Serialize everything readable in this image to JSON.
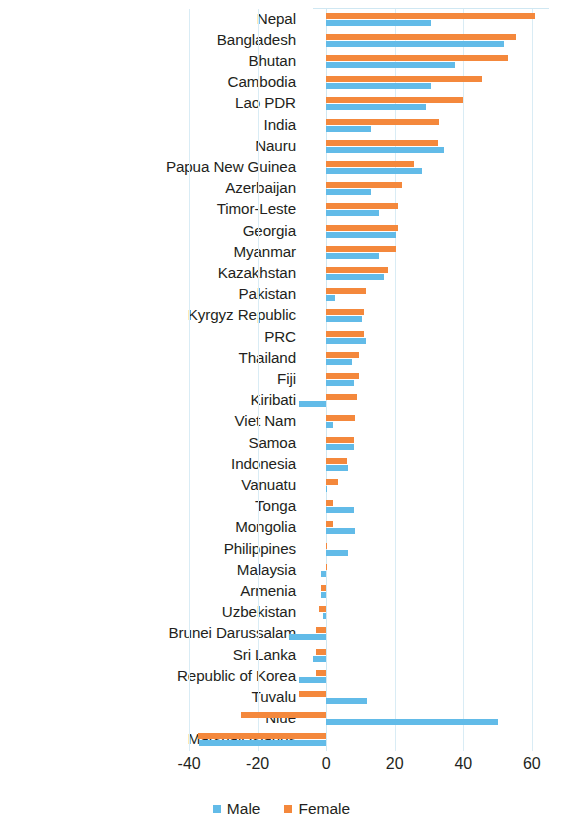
{
  "chart_data": {
    "type": "bar",
    "orientation": "horizontal",
    "title": "",
    "subtitle": "",
    "xlabel": "",
    "ylabel": "",
    "xlim": [
      -45,
      65
    ],
    "xticks": [
      "-40",
      "-20",
      "0",
      "20",
      "40",
      "60"
    ],
    "xtick_values": [
      -40,
      -20,
      0,
      20,
      40,
      60
    ],
    "grid": true,
    "legend_position": "bottom",
    "categories": [
      "Nepal",
      "Bangladesh",
      "Bhutan",
      "Cambodia",
      "Lao PDR",
      "India",
      "Nauru",
      "Papua New Guinea",
      "Azerbaijan",
      "Timor-Leste",
      "Georgia",
      "Myanmar",
      "Kazakhstan",
      "Pakistan",
      "Kyrgyz Republic",
      "PRC",
      "Thailand",
      "Fiji",
      "Kiribati",
      "Viet Nam",
      "Samoa",
      "Indonesia",
      "Vanuatu",
      "Tonga",
      "Mongolia",
      "Philippines",
      "Malaysia",
      "Armenia",
      "Uzbekistan",
      "Brunei Darussalam",
      "Sri Lanka",
      "Republic of Korea",
      "Tuvalu",
      "Niue",
      "Marshall Islands"
    ],
    "series": [
      {
        "name": "Female",
        "color": "#f4883c",
        "values": [
          61,
          55.5,
          53,
          45.5,
          40,
          33,
          32.5,
          25.5,
          22,
          21,
          21,
          20.5,
          18,
          11.5,
          11,
          11,
          9.5,
          9.5,
          9,
          8.5,
          8,
          6,
          3.5,
          2,
          2,
          0.3,
          0.2,
          -1.5,
          -2,
          -3,
          -3,
          -3,
          -8,
          -25,
          -37.5
        ]
      },
      {
        "name": "Male",
        "color": "#62bbe8",
        "values": [
          30.5,
          52,
          37.5,
          30.5,
          29,
          13,
          34.5,
          28,
          13,
          15.5,
          20.5,
          15.5,
          17,
          2.5,
          10.5,
          11.5,
          7.5,
          8,
          -8,
          2,
          8,
          6.5,
          0.2,
          8,
          8.5,
          6.5,
          -1.5,
          -1.5,
          -1,
          -11,
          -4,
          -8,
          12,
          50,
          -37
        ]
      }
    ]
  },
  "legend": {
    "items": [
      {
        "label": "Male",
        "color": "#62bbe8",
        "swatch": "male-legend-swatch"
      },
      {
        "label": "Female",
        "color": "#f4883c",
        "swatch": "female-legend-swatch"
      }
    ]
  }
}
